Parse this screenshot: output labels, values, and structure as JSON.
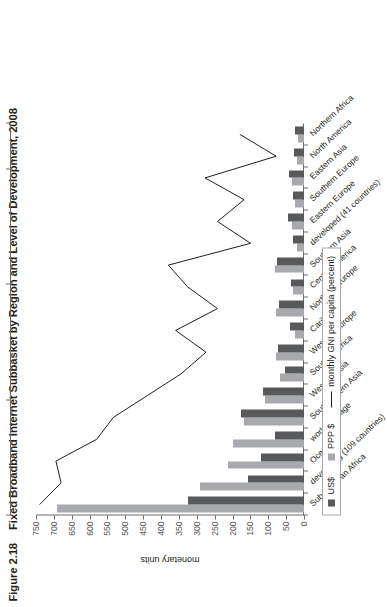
{
  "figure": {
    "number": "Figure 2.18",
    "title": "Fixed Broadband Internet Subbasket by Region and Level of Development, 2008"
  },
  "legend": {
    "usd_label": "US$",
    "ppp_label": "PPP $",
    "line_label": "monthly GNI per capita (percent)"
  },
  "axes": {
    "left_title": "monetary units",
    "left_ticks": [
      "750",
      "700",
      "650",
      "600",
      "550",
      "500",
      "450",
      "400",
      "350",
      "300",
      "250",
      "200",
      "150",
      "100",
      "50",
      "0"
    ],
    "top_ticks": [
      "1000",
      "100",
      "10",
      "1",
      "0"
    ]
  },
  "chart_data": {
    "type": "bar",
    "title": "Fixed Broadband Internet Subbasket by Region and Level of Development, 2008",
    "xlabel": "",
    "ylabel": "monetary units",
    "ylim": [
      0,
      750
    ],
    "y2label": "monthly GNI per capita (percent)",
    "y2lim": [
      0,
      1000
    ],
    "y2scale": "log",
    "grid": false,
    "legend_position": "bottom-left",
    "categories": [
      "Sub-Saharan Africa",
      "developing (109 countries)",
      "Oceania",
      "world average",
      "Southeastern Asia",
      "Western Asia",
      "South America",
      "Western Europe",
      "Caribbean",
      "Northern Europe",
      "Central America",
      "Southern Asia",
      "developed (41 countries)",
      "Eastern Europe",
      "Southern Europe",
      "Eastern Asia",
      "North America",
      "Northern Africa"
    ],
    "series": [
      {
        "name": "US$",
        "color": "#58595b",
        "values": [
          325,
          158,
          121,
          82,
          175,
          115,
          52,
          72,
          38,
          70,
          36,
          75,
          30,
          45,
          32,
          42,
          28,
          26
        ]
      },
      {
        "name": "PPP $",
        "color": "#a7a9ac",
        "values": [
          690,
          292,
          212,
          198,
          168,
          108,
          68,
          78,
          25,
          79,
          30,
          82,
          21,
          33,
          25,
          35,
          19,
          17
        ]
      },
      {
        "name": "monthly GNI per capita (percent)",
        "color": "#231f20",
        "type": "line",
        "values": [
          900,
          480,
          560,
          170,
          105,
          39,
          14.5,
          7.0,
          17.0,
          5.0,
          12.0,
          21.0,
          1.9,
          5.0,
          2.3,
          7.2,
          0.9,
          2.6
        ]
      }
    ]
  }
}
